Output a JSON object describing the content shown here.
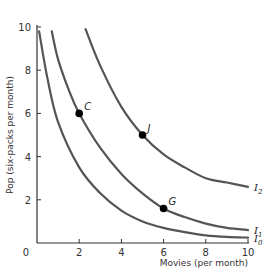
{
  "chart_data": {
    "type": "line",
    "title": "",
    "xlabel": "Movies (per month)",
    "ylabel": "Pop (six-packs per month)",
    "xlim": [
      0,
      10
    ],
    "ylim": [
      0,
      10
    ],
    "x_ticks": [
      "2",
      "4",
      "6",
      "8",
      "10"
    ],
    "y_ticks": [
      "2",
      "4",
      "6",
      "8",
      "10"
    ],
    "origin_label": "0",
    "grid": false,
    "legend": "inline labels at right end of curves",
    "series": [
      {
        "name": "I0",
        "label_main": "I",
        "label_sub": "0",
        "points": [
          [
            0.1,
            9.8
          ],
          [
            0.5,
            7.6
          ],
          [
            1,
            5.6
          ],
          [
            2,
            3.5
          ],
          [
            3,
            2.3
          ],
          [
            4,
            1.5
          ],
          [
            5,
            1.0
          ],
          [
            6,
            0.7
          ],
          [
            7,
            0.5
          ],
          [
            8,
            0.35
          ],
          [
            9,
            0.28
          ],
          [
            10,
            0.25
          ]
        ]
      },
      {
        "name": "I1",
        "label_main": "I",
        "label_sub": "1",
        "points": [
          [
            0.7,
            9.8
          ],
          [
            1,
            8.5
          ],
          [
            1.5,
            7.1
          ],
          [
            2,
            6.0
          ],
          [
            3,
            4.4
          ],
          [
            4,
            3.2
          ],
          [
            5,
            2.3
          ],
          [
            6,
            1.6
          ],
          [
            7,
            1.2
          ],
          [
            8,
            0.9
          ],
          [
            9,
            0.7
          ],
          [
            10,
            0.6
          ]
        ]
      },
      {
        "name": "I2",
        "label_main": "I",
        "label_sub": "2",
        "points": [
          [
            2.3,
            9.9
          ],
          [
            3,
            8.2
          ],
          [
            4,
            6.3
          ],
          [
            5,
            5.0
          ],
          [
            6,
            4.1
          ],
          [
            7,
            3.5
          ],
          [
            8,
            3.0
          ],
          [
            9,
            2.8
          ],
          [
            10,
            2.6
          ]
        ]
      }
    ],
    "annotations": [
      {
        "label": "C",
        "x": 2,
        "y": 6,
        "curve": "I1"
      },
      {
        "label": "J",
        "x": 5,
        "y": 5,
        "curve": "I2"
      },
      {
        "label": "G",
        "x": 6,
        "y": 1.6,
        "curve": "I1"
      }
    ]
  },
  "colors": {
    "curve": "#555555",
    "axis": "#333333",
    "point": "#000000"
  }
}
